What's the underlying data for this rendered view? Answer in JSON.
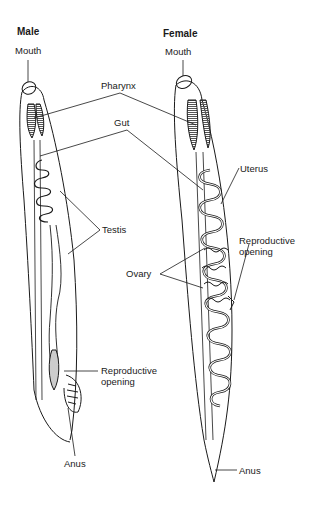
{
  "diagram": {
    "male": {
      "title": "Male",
      "labels": {
        "mouth": "Mouth",
        "pharynx": "Pharynx",
        "gut": "Gut",
        "testis": "Testis",
        "reproductive_opening": [
          "Reproductive",
          "opening"
        ],
        "anus": "Anus"
      }
    },
    "female": {
      "title": "Female",
      "labels": {
        "mouth": "Mouth",
        "uterus": "Uterus",
        "reproductive_opening": [
          "Reproductive",
          "opening"
        ],
        "ovary": "Ovary",
        "anus": "Anus"
      }
    },
    "colors": {
      "line": "#1a1a1a",
      "background": "#ffffff",
      "shading": "#7a7a7a"
    }
  }
}
